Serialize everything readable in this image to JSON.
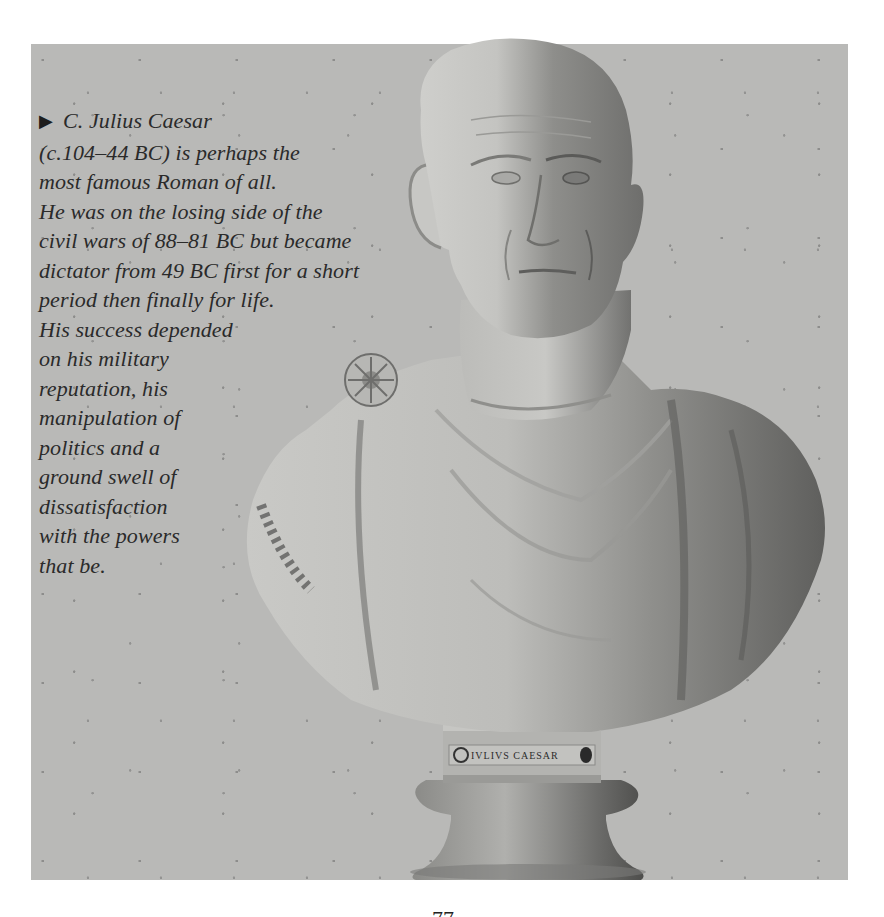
{
  "figure": {
    "plaque_inscription": "IVLIVS CAESAR",
    "panel_color": "#b9b9b7",
    "page_background": "#ffffff"
  },
  "caption": {
    "marker_icon": "right-triangle-bullet",
    "marker_glyph": "▶",
    "lines": [
      "C. Julius Caesar",
      "(c.104–44 BC) is perhaps the",
      "most famous Roman of all.",
      "He was on the losing side of the",
      "civil wars of 88–81 BC but became",
      "dictator from 49 BC first for a short",
      "period then finally for life.",
      "His success depended",
      "on his military",
      "reputation, his",
      "manipulation of",
      "politics and a",
      "ground swell of",
      "dissatisfaction",
      "with the powers",
      "that be."
    ]
  },
  "footer": {
    "page_number": "77"
  }
}
